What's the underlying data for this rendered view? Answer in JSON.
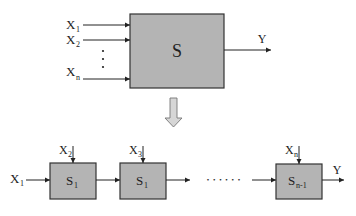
{
  "colors": {
    "box_fill": "#b4b4b4",
    "box_stroke": "#333333",
    "line": "#222222",
    "transform_arrow_fill": "#d6d6d6",
    "transform_arrow_stroke": "#777777"
  },
  "top": {
    "system_label": "S",
    "inputs": [
      {
        "name": "X",
        "sub": "1"
      },
      {
        "name": "X",
        "sub": "2"
      },
      {
        "name": "X",
        "sub": "n"
      }
    ],
    "ellipsis": "⋮",
    "output_label": "Y"
  },
  "transform_arrow": "down-arrow",
  "bottom": {
    "initial_input": {
      "name": "X",
      "sub": "1"
    },
    "stages": [
      {
        "label": "S",
        "sub": "1",
        "side_input": {
          "name": "X",
          "sub": "2"
        }
      },
      {
        "label": "S",
        "sub": "1",
        "side_input": {
          "name": "X",
          "sub": "3"
        }
      },
      {
        "label": "S",
        "sub": "n-1",
        "side_input": {
          "name": "X",
          "sub": "n"
        }
      }
    ],
    "ellipsis": "• • • • • •",
    "output_label": "Y"
  }
}
